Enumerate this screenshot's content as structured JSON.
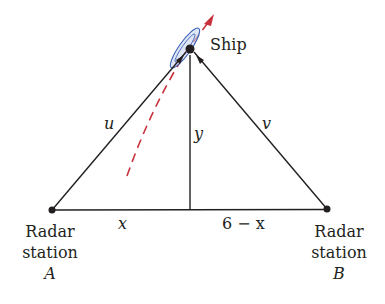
{
  "labels": {
    "ship": "Ship",
    "u": "u",
    "v": "v",
    "y": "y",
    "x": "x",
    "six_minus_x": "6 − x",
    "station_a_line1": "Radar",
    "station_a_line2": "station",
    "station_a_name": "A",
    "station_b_line1": "Radar",
    "station_b_line2": "station",
    "station_b_name": "B"
  },
  "colors": {
    "line": "#231f20",
    "path": "#c8323c",
    "ship_outline": "#3b5fb8",
    "ship_fill": "#c9d7f0"
  }
}
